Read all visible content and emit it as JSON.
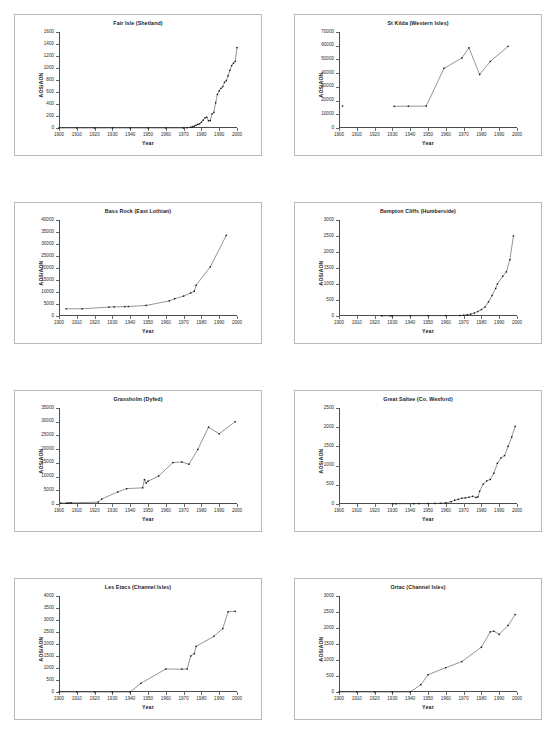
{
  "page": {
    "layout": "2-column x 4-row grid of line charts",
    "background_color": "#ffffff",
    "panel_border_color": "#b9b9b9",
    "series_color": "#3a3a3a",
    "marker_color": "#111111"
  },
  "common": {
    "xlabel": "Year",
    "ylabel": "AOS/AON",
    "xlim": [
      1900,
      2000
    ],
    "xticks": [
      1900,
      1910,
      1920,
      1930,
      1940,
      1950,
      1960,
      1970,
      1980,
      1990,
      2000
    ],
    "xtick_labels": [
      "1900",
      "1910",
      "1920",
      "1930",
      "1940",
      "1950",
      "1960",
      "1970",
      "1980",
      "1990",
      "2000"
    ],
    "grid": false,
    "legend": "none",
    "marker": "filled-square"
  },
  "chart_data": [
    {
      "type": "line",
      "title": "Fair Isle (Shetland)",
      "xlabel": "Year",
      "ylabel": "AOS/AON",
      "xlim": [
        1900,
        2000
      ],
      "ylim": [
        0,
        1600
      ],
      "yticks": [
        0,
        200,
        400,
        600,
        800,
        1000,
        1200,
        1400,
        1600
      ],
      "ytick_labels": [
        "0",
        "200",
        "400",
        "600",
        "800",
        "1000",
        "1200",
        "1400",
        "1600"
      ],
      "x": [
        1900,
        1910,
        1920,
        1930,
        1940,
        1950,
        1960,
        1970,
        1972,
        1974,
        1975,
        1976,
        1977,
        1978,
        1979,
        1980,
        1981,
        1982,
        1983,
        1984,
        1985,
        1986,
        1987,
        1988,
        1989,
        1990,
        1991,
        1992,
        1993,
        1994,
        1995,
        1996,
        1997,
        1998,
        1999,
        2000
      ],
      "y": [
        0,
        0,
        0,
        0,
        0,
        0,
        0,
        0,
        5,
        12,
        20,
        30,
        45,
        60,
        70,
        95,
        130,
        170,
        180,
        120,
        125,
        235,
        260,
        420,
        560,
        620,
        660,
        690,
        760,
        790,
        870,
        960,
        1040,
        1080,
        1110,
        1340
      ]
    },
    {
      "type": "line",
      "title": "St Kilda (Western Isles)",
      "xlabel": "Year",
      "ylabel": "AOS/AON",
      "xlim": [
        1900,
        2000
      ],
      "ylim": [
        0,
        70000
      ],
      "yticks": [
        0,
        10000,
        20000,
        30000,
        40000,
        50000,
        60000,
        70000
      ],
      "ytick_labels": [
        "0",
        "10000",
        "20000",
        "30000",
        "40000",
        "50000",
        "60000",
        "70000"
      ],
      "x": [
        1902,
        1931,
        1939,
        1949,
        1959,
        1969,
        1973,
        1979,
        1985,
        1995
      ],
      "y": [
        16000,
        15800,
        15900,
        16000,
        43500,
        51000,
        58500,
        39000,
        48500,
        59500
      ],
      "notes": "first point (1902) isolated, no connecting line"
    },
    {
      "type": "line",
      "title": "Bass Rock (East Lothian)",
      "xlabel": "Year",
      "ylabel": "AOS/AON",
      "xlim": [
        1900,
        2000
      ],
      "ylim": [
        0,
        40000
      ],
      "yticks": [
        0,
        5000,
        10000,
        15000,
        20000,
        25000,
        30000,
        35000,
        40000
      ],
      "ytick_labels": [
        "0",
        "5000",
        "10000",
        "15000",
        "20000",
        "25000",
        "30000",
        "35000",
        "40000"
      ],
      "x": [
        1904,
        1913,
        1928,
        1931,
        1937,
        1939,
        1949,
        1962,
        1965,
        1970,
        1974,
        1976,
        1977,
        1985,
        1994
      ],
      "y": [
        3000,
        3000,
        3700,
        3800,
        3900,
        3950,
        4400,
        6300,
        7200,
        8300,
        9600,
        10300,
        12800,
        20500,
        33600
      ]
    },
    {
      "type": "line",
      "title": "Bempton Cliffs (Humberside)",
      "xlabel": "Year",
      "ylabel": "AOS/AON",
      "xlim": [
        1900,
        2000
      ],
      "ylim": [
        0,
        3000
      ],
      "yticks": [
        0,
        500,
        1000,
        1500,
        2000,
        2500,
        3000
      ],
      "ytick_labels": [
        "0",
        "500",
        "1000",
        "1500",
        "2000",
        "2500",
        "3000"
      ],
      "x": [
        1924,
        1929,
        1930,
        1940,
        1950,
        1960,
        1968,
        1970,
        1972,
        1974,
        1976,
        1978,
        1980,
        1982,
        1984,
        1986,
        1988,
        1989,
        1992,
        1994,
        1996,
        1998
      ],
      "y": [
        2,
        4,
        5,
        8,
        10,
        12,
        15,
        22,
        40,
        60,
        90,
        140,
        200,
        280,
        440,
        640,
        860,
        1000,
        1240,
        1380,
        1760,
        2500
      ]
    },
    {
      "type": "line",
      "title": "Grassholm (Dyfed)",
      "xlabel": "Year",
      "ylabel": "AOS/AON",
      "xlim": [
        1900,
        2000
      ],
      "ylim": [
        0,
        35000
      ],
      "yticks": [
        0,
        5000,
        10000,
        15000,
        20000,
        25000,
        30000,
        35000
      ],
      "ytick_labels": [
        "0",
        "5000",
        "10000",
        "15000",
        "20000",
        "25000",
        "30000",
        "35000"
      ],
      "x": [
        1901,
        1904,
        1905,
        1906,
        1907,
        1922,
        1924,
        1933,
        1938,
        1947,
        1948,
        1949,
        1950,
        1956,
        1964,
        1969,
        1973,
        1978,
        1984,
        1990,
        1999
      ],
      "y": [
        300,
        300,
        350,
        350,
        400,
        700,
        1800,
        4400,
        5600,
        5900,
        8900,
        7600,
        8300,
        10200,
        15100,
        15300,
        14500,
        19900,
        28000,
        25600,
        30000
      ]
    },
    {
      "type": "line",
      "title": "Great Saltee (Co. Wexford)",
      "xlabel": "Year",
      "ylabel": "AOS/AON",
      "xlim": [
        1900,
        2000
      ],
      "ylim": [
        0,
        2500
      ],
      "yticks": [
        0,
        500,
        1000,
        1500,
        2000,
        2500
      ],
      "ytick_labels": [
        "0",
        "500",
        "1000",
        "1500",
        "2000",
        "2500"
      ],
      "x": [
        1930,
        1932,
        1942,
        1945,
        1950,
        1954,
        1957,
        1960,
        1963,
        1965,
        1967,
        1969,
        1971,
        1973,
        1975,
        1977,
        1978,
        1979,
        1981,
        1983,
        1985,
        1987,
        1989,
        1991,
        1993,
        1995,
        1997,
        1999
      ],
      "y": [
        4,
        6,
        8,
        10,
        12,
        14,
        18,
        30,
        60,
        100,
        120,
        150,
        160,
        175,
        200,
        170,
        185,
        330,
        520,
        600,
        640,
        800,
        1060,
        1200,
        1260,
        1500,
        1740,
        2020
      ]
    },
    {
      "type": "line",
      "title": "Les Etacs (Channel Isles)",
      "xlabel": "Year",
      "ylabel": "AOS/AON",
      "xlim": [
        1900,
        2000
      ],
      "ylim": [
        0,
        4000
      ],
      "yticks": [
        0,
        500,
        1000,
        1500,
        2000,
        2500,
        3000,
        3500,
        4000
      ],
      "ytick_labels": [
        "0",
        "500",
        "1000",
        "1500",
        "2000",
        "2500",
        "3000",
        "3500",
        "4000"
      ],
      "x": [
        1900,
        1910,
        1920,
        1930,
        1940,
        1946,
        1960,
        1969,
        1972,
        1974,
        1976,
        1977,
        1987,
        1992,
        1995,
        1999
      ],
      "y": [
        0,
        0,
        0,
        0,
        0,
        360,
        960,
        950,
        960,
        1500,
        1600,
        1900,
        2320,
        2640,
        3340,
        3360
      ]
    },
    {
      "type": "line",
      "title": "Ortac (Channel Isles)",
      "xlabel": "Year",
      "ylabel": "AOS/AON",
      "xlim": [
        1900,
        2000
      ],
      "ylim": [
        0,
        3000
      ],
      "yticks": [
        0,
        500,
        1000,
        1500,
        2000,
        2500,
        3000
      ],
      "ytick_labels": [
        "0",
        "500",
        "1000",
        "1500",
        "2000",
        "2500",
        "3000"
      ],
      "x": [
        1900,
        1910,
        1920,
        1930,
        1940,
        1946,
        1950,
        1960,
        1969,
        1980,
        1985,
        1987,
        1990,
        1995,
        1999
      ],
      "y": [
        0,
        0,
        0,
        0,
        0,
        230,
        540,
        760,
        950,
        1400,
        1880,
        1900,
        1800,
        2080,
        2420
      ]
    }
  ]
}
